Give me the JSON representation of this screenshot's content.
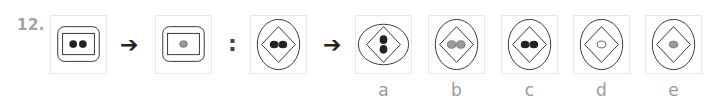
{
  "question": {
    "number": "12.",
    "arrow_symbol": "➔",
    "colon_symbol": ":",
    "analogy": [
      {
        "id": "pair1-left",
        "outer": "rounded-rectangle",
        "inner": "rectangle",
        "dots": 2,
        "dot_color": "#222222",
        "orientation": "horizontal"
      },
      {
        "id": "pair1-right",
        "outer": "rounded-rectangle",
        "inner": "rectangle",
        "dots": 1,
        "dot_color": "#9a9a9a",
        "orientation": "center"
      },
      {
        "id": "pair2-left",
        "outer": "ellipse",
        "inner": "diamond",
        "dots": 2,
        "dot_color": "#222222",
        "orientation": "horizontal"
      }
    ],
    "options": [
      {
        "label": "a",
        "outer": "ellipse-wide",
        "inner": "diamond",
        "dots": 2,
        "dot_color": "#222222",
        "orientation": "vertical"
      },
      {
        "label": "b",
        "outer": "ellipse",
        "inner": "diamond",
        "dots": 2,
        "dot_color": "#9a9a9a",
        "orientation": "horizontal"
      },
      {
        "label": "c",
        "outer": "ellipse",
        "inner": "diamond",
        "dots": 2,
        "dot_color": "#222222",
        "orientation": "horizontal"
      },
      {
        "label": "d",
        "outer": "ellipse",
        "inner": "diamond",
        "dots": 1,
        "dot_color": "#ffffff",
        "orientation": "center"
      },
      {
        "label": "e",
        "outer": "ellipse",
        "inner": "diamond",
        "dots": 1,
        "dot_color": "#9a9a9a",
        "orientation": "center"
      }
    ]
  }
}
